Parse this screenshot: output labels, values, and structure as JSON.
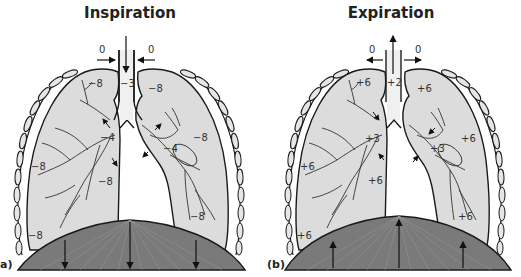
{
  "figure": "Pressure changes in lungs during breathing",
  "colors": {
    "lung_fill": "#dcdcdc",
    "diaphragm_fill": "#7a7a7a",
    "outline": "#1a1a1a",
    "rib_fill": "#e6e6e6"
  },
  "panels": [
    {
      "id": "a",
      "label": "a)",
      "title": "Inspiration",
      "air_flow": "inward",
      "diaphragm_motion": "down",
      "values": {
        "atmosphere_left": "0",
        "atmosphere_right": "0",
        "trachea": "−3",
        "left_upper": "−8",
        "right_upper": "−8",
        "left_bronchus": "−4",
        "right_bronchus": "−4",
        "left_mid": "−8",
        "left_center": "−8",
        "right_mid": "−8",
        "left_lower": "−8",
        "right_lower": "−8"
      }
    },
    {
      "id": "b",
      "label": "(b)",
      "title": "Expiration",
      "air_flow": "outward",
      "diaphragm_motion": "up",
      "values": {
        "atmosphere_left": "0",
        "atmosphere_right": "0",
        "trachea": "+2",
        "left_upper": "+6",
        "right_upper": "+6",
        "left_bronchus": "+3",
        "right_bronchus": "+3",
        "left_mid": "+6",
        "left_center": "+6",
        "right_mid": "+6",
        "left_lower": "+6",
        "right_lower": "+6"
      }
    }
  ]
}
